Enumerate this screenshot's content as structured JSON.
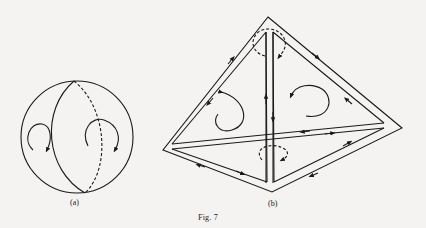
{
  "figure": {
    "caption": "Fig. 7",
    "panels": [
      {
        "id": "a",
        "label": "(a)",
        "description": "Sphere with meridian great circle; front half solid, back half dashed; two circular orientation arrows on either hemisphere"
      },
      {
        "id": "b",
        "label": "(b)",
        "description": "Tetrahedron with doubled edges; edge arrows indicate induced orientations cancelling on shared edges; circular arrows on each face (dashed on hidden faces)"
      }
    ],
    "colors": {
      "ink": "#1a1a1a",
      "paper": "#f4f3f1"
    }
  }
}
